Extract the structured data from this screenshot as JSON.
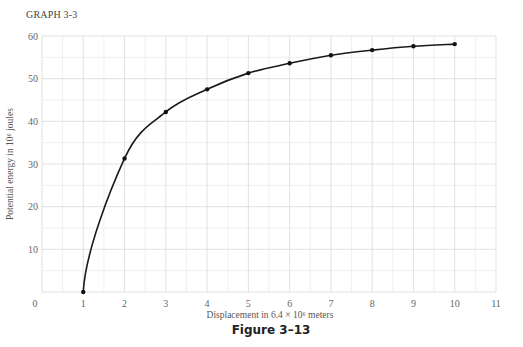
{
  "graph_label": "GRAPH 3-3",
  "chart_data": {
    "type": "line",
    "title": "GRAPH 3-3",
    "caption": "Figure 3–13",
    "xlabel": "Displacement in 6.4 × 10⁶ meters",
    "ylabel": "Potential energy in 10⁶ joules",
    "xlim": [
      0,
      11
    ],
    "ylim": [
      0,
      60
    ],
    "x_ticks": [
      "0",
      "1",
      "2",
      "3",
      "4",
      "5",
      "6",
      "7",
      "8",
      "9",
      "10",
      "11"
    ],
    "y_ticks": [
      "10",
      "20",
      "30",
      "40",
      "50",
      "60"
    ],
    "grid": true,
    "series": [
      {
        "name": "Potential energy",
        "x": [
          1,
          2,
          3,
          4,
          5,
          6,
          7,
          8,
          9,
          10
        ],
        "y": [
          0,
          31.3,
          42.2,
          47.5,
          51.3,
          53.6,
          55.5,
          56.7,
          57.6,
          58.1
        ]
      }
    ]
  }
}
